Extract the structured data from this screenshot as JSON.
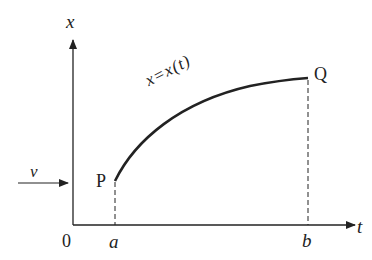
{
  "diagram": {
    "y_axis_label": "x",
    "x_axis_label": "t",
    "origin_label": "0",
    "tick_a": "a",
    "tick_b": "b",
    "point_start": "P",
    "point_end": "Q",
    "curve_label": "x=x(t)",
    "arrow_label": "v",
    "colors": {
      "ink": "#222222",
      "background": "#ffffff"
    }
  }
}
